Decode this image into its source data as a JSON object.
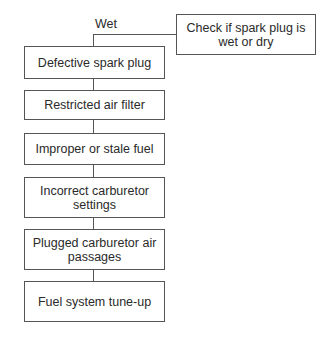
{
  "diagram": {
    "start": {
      "text": "Check if spark plug is wet or dry"
    },
    "branch_label": "Wet",
    "steps": [
      {
        "text": "Defective spark plug"
      },
      {
        "text": "Restricted air filter"
      },
      {
        "text": "Improper or stale fuel"
      },
      {
        "text": "Incorrect carburetor settings"
      },
      {
        "text": "Plugged carburetor air passages"
      },
      {
        "text": "Fuel system tune-up"
      }
    ]
  }
}
